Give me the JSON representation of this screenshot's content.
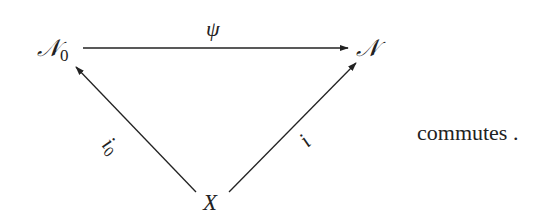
{
  "diagram": {
    "type": "commutative-triangle",
    "nodes": {
      "top_left": {
        "symbol": "𝒩",
        "subscript": "0"
      },
      "top_right": {
        "symbol": "𝒩"
      },
      "bottom": {
        "symbol": "X"
      }
    },
    "arrows": [
      {
        "from": "top_left",
        "to": "top_right",
        "label": "ψ"
      },
      {
        "from": "bottom",
        "to": "top_left",
        "label": "i",
        "label_subscript": "0"
      },
      {
        "from": "bottom",
        "to": "top_right",
        "label": "i"
      }
    ],
    "caption": "commutes ."
  }
}
